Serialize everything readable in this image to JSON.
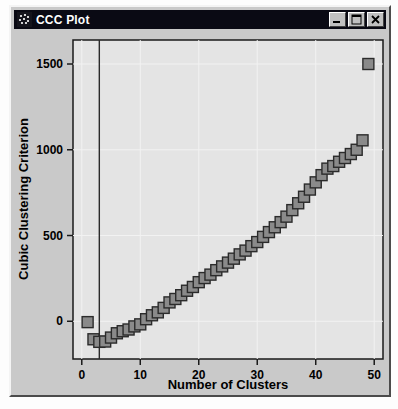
{
  "window": {
    "title": "CCC Plot",
    "icon": "scatter-dots-icon",
    "buttons": {
      "minimize": "minimize-icon",
      "maximize": "maximize-icon",
      "close": "close-icon"
    },
    "colors": {
      "titlebar_bg": "#0a0a14",
      "titlebar_fg": "#ffffff",
      "window_bg": "#c9c9c9",
      "plot_bg": "#e4e4e4",
      "marker_fill": "#8a8a8a",
      "marker_stroke": "#2b2b2b",
      "frame": "#1a1a1a",
      "gridline": "#f2f2f2",
      "reference_line": "#2b2b2b"
    }
  },
  "chart_data": {
    "type": "scatter",
    "title": "",
    "xlabel": "Number of Clusters",
    "ylabel": "Cubic Clustering Criterion",
    "xlim": [
      -1.5,
      51.5
    ],
    "ylim": [
      -220,
      1640
    ],
    "xticks": [
      0,
      10,
      20,
      30,
      40,
      50
    ],
    "xticklabels": [
      "0",
      "10",
      "20",
      "30",
      "40",
      "50"
    ],
    "yticks": [
      0,
      500,
      1000,
      1500
    ],
    "yticklabels": [
      "0",
      "500",
      "1000",
      "1500"
    ],
    "grid": true,
    "legend": false,
    "marker": "square",
    "annotations": [
      {
        "name": "reference-line",
        "type": "vline",
        "x": 3
      }
    ],
    "x": [
      1,
      2,
      3,
      4,
      5,
      6,
      7,
      8,
      9,
      10,
      11,
      12,
      13,
      14,
      15,
      16,
      17,
      18,
      19,
      20,
      21,
      22,
      23,
      24,
      25,
      26,
      27,
      28,
      29,
      30,
      31,
      32,
      33,
      34,
      35,
      36,
      37,
      38,
      39,
      40,
      41,
      42,
      43,
      44,
      45,
      46,
      47,
      48,
      49
    ],
    "y": [
      -5,
      -105,
      -120,
      -118,
      -95,
      -70,
      -58,
      -48,
      -30,
      -18,
      12,
      35,
      52,
      78,
      110,
      130,
      152,
      178,
      200,
      228,
      252,
      272,
      298,
      320,
      342,
      365,
      390,
      412,
      438,
      462,
      492,
      520,
      548,
      578,
      610,
      648,
      688,
      726,
      768,
      810,
      852,
      890,
      905,
      930,
      952,
      975,
      1000,
      1055,
      1500
    ]
  }
}
